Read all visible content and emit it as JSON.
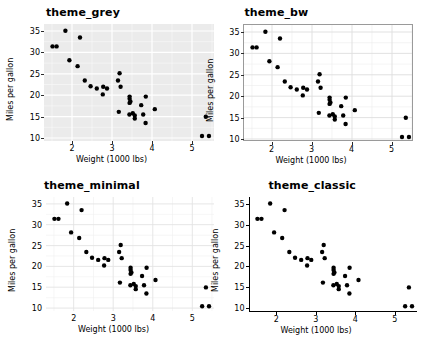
{
  "figure": {
    "layout": "2x2-grid",
    "width": 437,
    "height": 352,
    "background": "#ffffff"
  },
  "panels": [
    {
      "id": "theme-grey",
      "title": "theme_grey",
      "panel_background": "#ebebeb",
      "grid_color": "#ffffff",
      "border": "none",
      "axis_line": "none",
      "tick_color": "#333333",
      "point_color": "#000000"
    },
    {
      "id": "theme-bw",
      "title": "theme_bw",
      "panel_background": "#ffffff",
      "grid_color": "#e2e2e2",
      "border": "#9a9a9a",
      "axis_line": "none",
      "tick_color": "#333333",
      "point_color": "#000000"
    },
    {
      "id": "theme-minimal",
      "title": "theme_minimal",
      "panel_background": "#ffffff",
      "grid_color": "#e4e4e4",
      "border": "none",
      "axis_line": "none",
      "tick_color": "none",
      "point_color": "#000000"
    },
    {
      "id": "theme-classic",
      "title": "theme_classic",
      "panel_background": "#ffffff",
      "grid_color": "none",
      "border": "none",
      "axis_line": "#000000",
      "tick_color": "#000000",
      "point_color": "#000000"
    }
  ],
  "chart_data": {
    "type": "scatter",
    "title": "",
    "xlabel": "Weight (1000 lbs)",
    "ylabel": "Miles per gallon",
    "xlim": [
      1.3,
      5.55
    ],
    "ylim": [
      9.3,
      35.4
    ],
    "xticks": [
      2,
      3,
      4,
      5
    ],
    "yticks": [
      10,
      15,
      20,
      25,
      30,
      35
    ],
    "grid": true,
    "legend": "none",
    "series": [
      {
        "name": "mtcars",
        "marker": "filled-circle",
        "color": "#000000",
        "x": [
          2.62,
          2.875,
          2.32,
          3.215,
          3.44,
          3.46,
          3.57,
          3.19,
          3.15,
          3.44,
          3.44,
          4.07,
          3.73,
          3.78,
          5.25,
          5.424,
          5.345,
          2.2,
          1.615,
          1.835,
          2.465,
          3.52,
          3.435,
          3.84,
          3.845,
          1.935,
          2.14,
          1.513,
          3.17,
          2.77,
          3.57,
          2.78
        ],
        "y": [
          21.0,
          21.0,
          22.8,
          21.4,
          18.7,
          18.1,
          14.3,
          24.4,
          22.8,
          19.2,
          17.8,
          16.4,
          17.3,
          15.2,
          10.4,
          10.4,
          14.7,
          32.4,
          30.4,
          33.9,
          21.5,
          15.5,
          15.2,
          13.3,
          19.2,
          27.3,
          26.0,
          30.4,
          15.8,
          19.7,
          15.0,
          21.4
        ]
      }
    ]
  }
}
